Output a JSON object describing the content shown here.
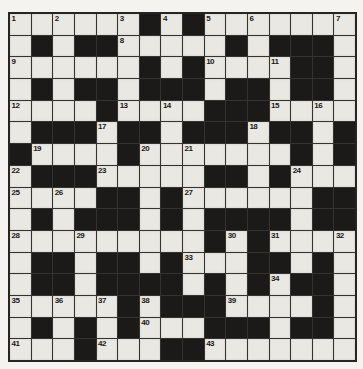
{
  "puzzle": {
    "kind": "crossword",
    "rows": 16,
    "cols": 16,
    "cells": [
      "......#.#.......",
      ".#.##.....#.###.",
      "......#.#....##.",
      ".#.##.###.##.##.",
      "....#....###....",
      ".###.##.###.##.#",
      "#....#.......#.#",
      ".###.....##.#...",
      "....##.#......##",
      ".#.###.#.####.##",
      ".........#.#....",
      ".##.##.#...##.#.",
      ".##.####.#.#.##.",
      ".....#.###....#.",
      ".#.#.#...###.##.",
      "...#...##......."
    ],
    "numbers": [
      [
        1,
        0,
        0
      ],
      [
        2,
        0,
        2
      ],
      [
        3,
        0,
        5
      ],
      [
        4,
        0,
        7
      ],
      [
        5,
        0,
        9
      ],
      [
        6,
        0,
        11
      ],
      [
        7,
        0,
        15
      ],
      [
        8,
        1,
        5
      ],
      [
        9,
        2,
        0
      ],
      [
        10,
        2,
        9
      ],
      [
        11,
        2,
        12
      ],
      [
        12,
        4,
        0
      ],
      [
        13,
        4,
        5
      ],
      [
        14,
        4,
        7
      ],
      [
        15,
        4,
        12
      ],
      [
        16,
        4,
        14
      ],
      [
        17,
        5,
        4
      ],
      [
        18,
        5,
        11
      ],
      [
        19,
        6,
        1
      ],
      [
        20,
        6,
        6
      ],
      [
        21,
        6,
        8
      ],
      [
        22,
        7,
        0
      ],
      [
        23,
        7,
        4
      ],
      [
        24,
        7,
        13
      ],
      [
        25,
        8,
        0
      ],
      [
        26,
        8,
        2
      ],
      [
        27,
        8,
        8
      ],
      [
        28,
        10,
        0
      ],
      [
        29,
        10,
        3
      ],
      [
        30,
        10,
        10
      ],
      [
        31,
        10,
        12
      ],
      [
        32,
        10,
        15
      ],
      [
        33,
        11,
        8
      ],
      [
        34,
        12,
        12
      ],
      [
        35,
        13,
        0
      ],
      [
        36,
        13,
        2
      ],
      [
        37,
        13,
        4
      ],
      [
        38,
        13,
        6
      ],
      [
        39,
        13,
        10
      ],
      [
        40,
        14,
        6
      ],
      [
        41,
        15,
        0
      ],
      [
        42,
        15,
        4
      ],
      [
        43,
        15,
        9
      ]
    ],
    "colors": {
      "white_cell": "#e9e8e3",
      "black_cell": "#1b1a18",
      "grid_line": "#35332f",
      "outer_border": "#262523",
      "page_background": "#f4f3f0",
      "number_text": "#191817"
    }
  }
}
